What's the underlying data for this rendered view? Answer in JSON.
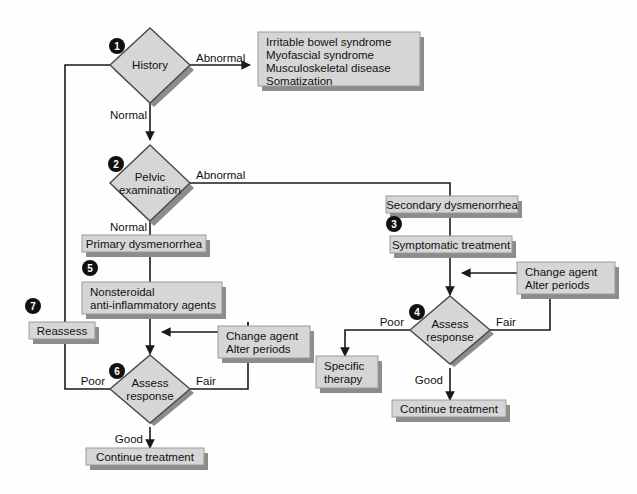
{
  "diagram": {
    "colors": {
      "node_fill": "#d6d6d6",
      "node_stroke": "#4a4a4a",
      "shadow": "#8c8c8c",
      "line": "#1a1a1a",
      "text": "#111111",
      "badge": "#111111",
      "background": "#fefefe"
    },
    "steps": [
      {
        "id": "1",
        "label": "1"
      },
      {
        "id": "2",
        "label": "2"
      },
      {
        "id": "3",
        "label": "3"
      },
      {
        "id": "4",
        "label": "4"
      },
      {
        "id": "5",
        "label": "5"
      },
      {
        "id": "6",
        "label": "6"
      },
      {
        "id": "7",
        "label": "7"
      }
    ],
    "nodes": {
      "history": {
        "type": "decision",
        "line1": "History",
        "line2": ""
      },
      "pelvic_exam": {
        "type": "decision",
        "line1": "Pelvic",
        "line2": "examination"
      },
      "differential": {
        "type": "box",
        "line1": "Irritable bowel syndrome",
        "line2": "Myofascial syndrome",
        "line3": "Musculoskeletal disease",
        "line4": "Somatization"
      },
      "secondary_dysmenorrhea": {
        "type": "box",
        "line1": "Secondary dysmenorrhea"
      },
      "symptomatic_treatment": {
        "type": "box",
        "line1": "Symptomatic treatment"
      },
      "primary_dysmenorrhea": {
        "type": "box",
        "line1": "Primary dysmenorrhea"
      },
      "nsaid": {
        "type": "box",
        "line1": "Nonsteroidal",
        "line2": "anti-inflammatory agents"
      },
      "assess_response_right": {
        "type": "decision",
        "line1": "Assess",
        "line2": "response"
      },
      "assess_response_left": {
        "type": "decision",
        "line1": "Assess",
        "line2": "response"
      },
      "change_agent_right": {
        "type": "box",
        "line1": "Change agent",
        "line2": "Alter periods"
      },
      "change_agent_left": {
        "type": "box",
        "line1": "Change agent",
        "line2": "Alter periods"
      },
      "specific_therapy": {
        "type": "box",
        "line1": "Specific",
        "line2": "therapy"
      },
      "continue_treatment_right": {
        "type": "box",
        "line1": "Continue treatment"
      },
      "continue_treatment_left": {
        "type": "box",
        "line1": "Continue treatment"
      },
      "reassess": {
        "type": "box",
        "line1": "Reassess"
      }
    },
    "edge_labels": {
      "history_abnormal": "Abnormal",
      "history_normal": "Normal",
      "pelvic_abnormal": "Abnormal",
      "pelvic_normal": "Normal",
      "right_poor": "Poor",
      "right_fair": "Fair",
      "right_good": "Good",
      "left_poor": "Poor",
      "left_fair": "Fair",
      "left_good": "Good"
    }
  }
}
